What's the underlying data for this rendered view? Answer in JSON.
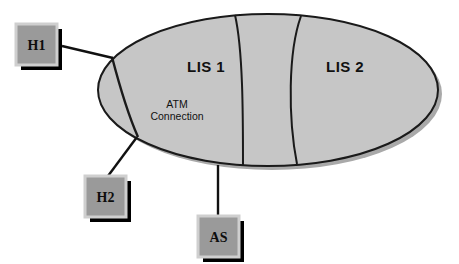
{
  "diagram": {
    "cloud": {
      "name": "atm-network-cloud",
      "fill_color": "#c6c6c6",
      "stroke_color": "#1a1a1a",
      "shadow_color": "#a9a9a9",
      "regions": [
        {
          "id": "lis1",
          "label": "LIS 1"
        },
        {
          "id": "lis2",
          "label": "LIS 2"
        }
      ]
    },
    "annotations": [
      {
        "id": "atm-connection",
        "line1": "ATM",
        "line2": "Connection"
      }
    ],
    "nodes": [
      {
        "id": "h1",
        "label": "H1",
        "fill_color": "#9a9a9a",
        "border_color": "#cfcfcf",
        "shadow_color": "#000000"
      },
      {
        "id": "h2",
        "label": "H2",
        "fill_color": "#9a9a9a",
        "border_color": "#cfcfcf",
        "shadow_color": "#000000"
      },
      {
        "id": "as",
        "label": "AS",
        "fill_color": "#9a9a9a",
        "border_color": "#cfcfcf",
        "shadow_color": "#000000"
      }
    ],
    "links": [
      {
        "id": "h1-to-cloud",
        "from": "h1",
        "to": "cloud"
      },
      {
        "id": "h2-to-cloud",
        "from": "h2",
        "to": "cloud"
      },
      {
        "id": "as-to-cloud",
        "from": "as",
        "to": "cloud"
      }
    ]
  }
}
